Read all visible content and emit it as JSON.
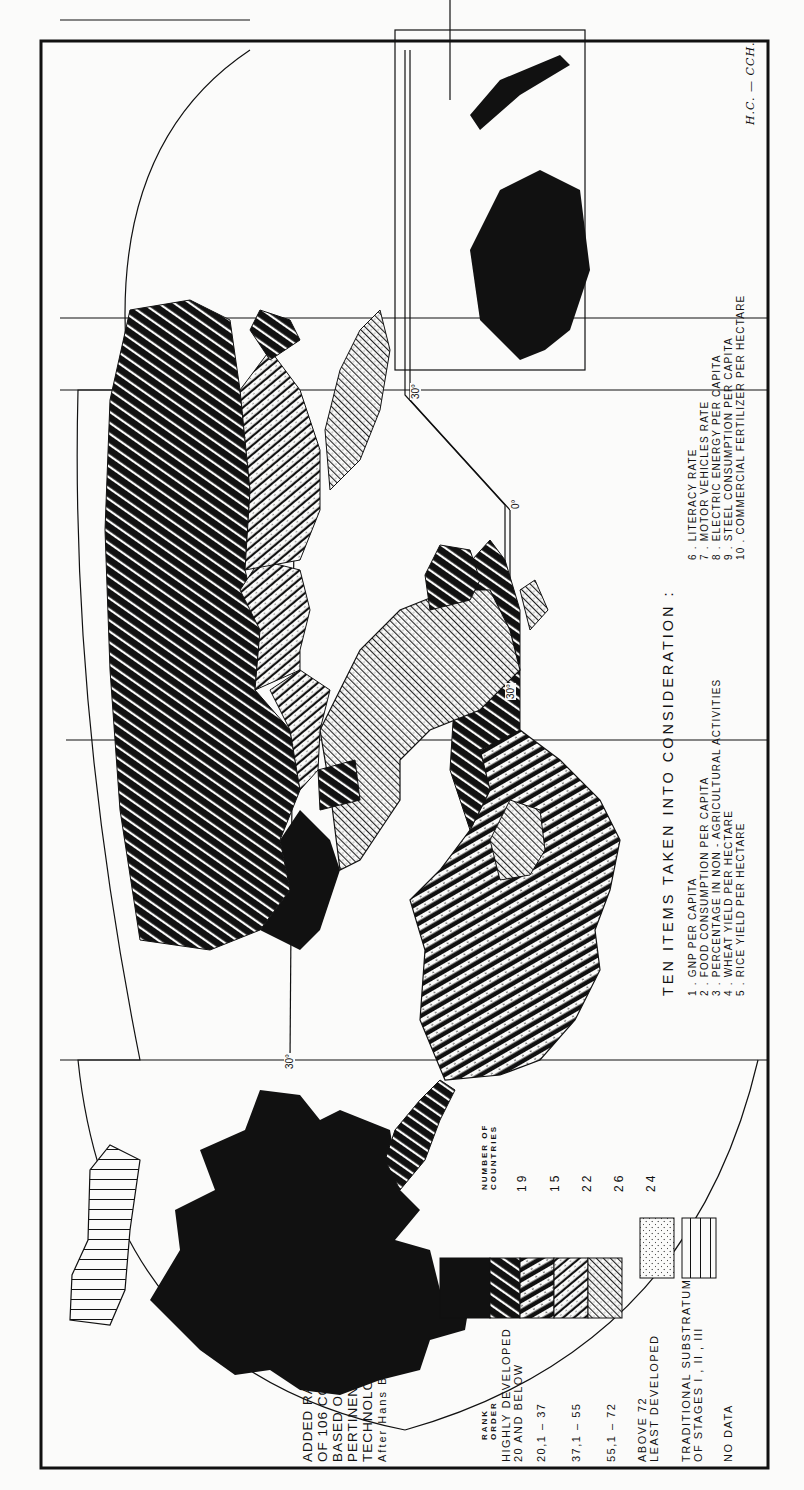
{
  "map": {
    "title_lines": [
      "ADDED RANK ORDERS",
      "OF   106  COUNTRIES",
      "BASED  ON  TEN",
      "PERTINENT  ITEMS  OF",
      "TECHNOLOGICAL  DEVELOPMENT (1959)"
    ],
    "author": "After  Hans  Bobek",
    "orientation": "rotated 90° counter-clockwise",
    "latitude_labels": [
      "30°",
      "0°",
      "30°",
      "30°"
    ],
    "credit": "H.C. — CCH."
  },
  "legend": {
    "rank_order_header": [
      "RANK",
      "ORDER"
    ],
    "count_header": [
      "NUMBER  OF",
      "COUNTRIES"
    ],
    "classes": [
      {
        "label": [
          "HIGHLY  DEVELOPED",
          "20  AND  BELOW"
        ],
        "count": "19",
        "pattern": "solid-black"
      },
      {
        "label": [
          "20,1  –  37"
        ],
        "count": "15",
        "pattern": "heavy-diagonal-dashed"
      },
      {
        "label": [
          "37,1  –  55"
        ],
        "count": "22",
        "pattern": "medium-diagonal-dotted"
      },
      {
        "label": [
          "55,1  –  72"
        ],
        "count": "26",
        "pattern": "light-diagonal-dotted"
      },
      {
        "label": [
          "ABOVE   72",
          "LEAST  DEVELOPED"
        ],
        "count": "24",
        "pattern": "fine-crosshatch-dotted"
      }
    ],
    "extra": [
      {
        "label": [
          "TRADITIONAL   SUBSTRATUM",
          "OF  STAGES   I , II , III"
        ],
        "pattern": "stipple"
      },
      {
        "label": [
          "NO  DATA"
        ],
        "pattern": "parallel-lines"
      }
    ]
  },
  "items": {
    "title": "TEN   ITEMS   TAKEN   INTO   CONSIDERATION :",
    "list": [
      {
        "num": "1 .",
        "text": "GNP   PER   CAPITA"
      },
      {
        "num": "2 .",
        "text": "FOOD   CONSUMPTION   PER   CAPITA"
      },
      {
        "num": "3 .",
        "text": "PERCENTAGE   IN   NON - AGRICULTURAL   ACTIVITIES"
      },
      {
        "num": "4 .",
        "text": "WHEAT   YIELD   PER   HECTARE"
      },
      {
        "num": "5 .",
        "text": "RICE   YIELD   PER   HECTARE"
      },
      {
        "num": "6 .",
        "text": "LITERACY   RATE"
      },
      {
        "num": "7 .",
        "text": "MOTOR   VEHICLES   RATE"
      },
      {
        "num": "8 .",
        "text": "ELECTRIC   ENERGY   PER   CAPITA"
      },
      {
        "num": "9 .",
        "text": "STEEL   CONSUMPTION   PER   CAPITA"
      },
      {
        "num": "10 .",
        "text": "COMMERCIAL   FERTILIZER   PER   HECTARE"
      }
    ]
  },
  "colors": {
    "ink": "#111111",
    "paper": "#fbfbfa"
  }
}
